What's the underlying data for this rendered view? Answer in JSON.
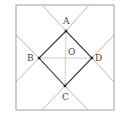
{
  "diagram": {
    "type": "geometry",
    "colors": {
      "outer_square": "#a0a0a0",
      "extension_lines": "#b0b0b0",
      "inner_square": "#333333",
      "diagonals": "#9a9a9a",
      "points": "#222222",
      "labels": "#444444"
    },
    "outer_square": {
      "x1": 16,
      "y1": 5,
      "x2": 114,
      "y2": 110
    },
    "points": [
      {
        "name": "A",
        "x": 66,
        "y": 31,
        "label": "A",
        "label_x": 63,
        "label_y": 24
      },
      {
        "name": "B",
        "x": 39,
        "y": 58,
        "label": "B",
        "label_x": 27,
        "label_y": 61
      },
      {
        "name": "C",
        "x": 65,
        "y": 86,
        "label": "C",
        "label_x": 62,
        "label_y": 100
      },
      {
        "name": "D",
        "x": 92,
        "y": 58,
        "label": "D",
        "label_x": 96,
        "label_y": 61
      },
      {
        "name": "O",
        "x": 66,
        "y": 58,
        "label": "O",
        "label_x": 68,
        "label_y": 54
      }
    ],
    "inner_square_sides": [
      "AB",
      "BC",
      "CD",
      "DA"
    ],
    "diagonals": [
      "AC",
      "BD"
    ],
    "extension_lines": [
      {
        "x1": 42,
        "y1": 5,
        "x2": 16,
        "y2": 32
      },
      {
        "x1": 89,
        "y1": 5,
        "x2": 114,
        "y2": 33
      },
      {
        "x1": 16,
        "y1": 84,
        "x2": 42,
        "y2": 110
      },
      {
        "x1": 114,
        "y1": 84,
        "x2": 88,
        "y2": 110
      }
    ]
  }
}
